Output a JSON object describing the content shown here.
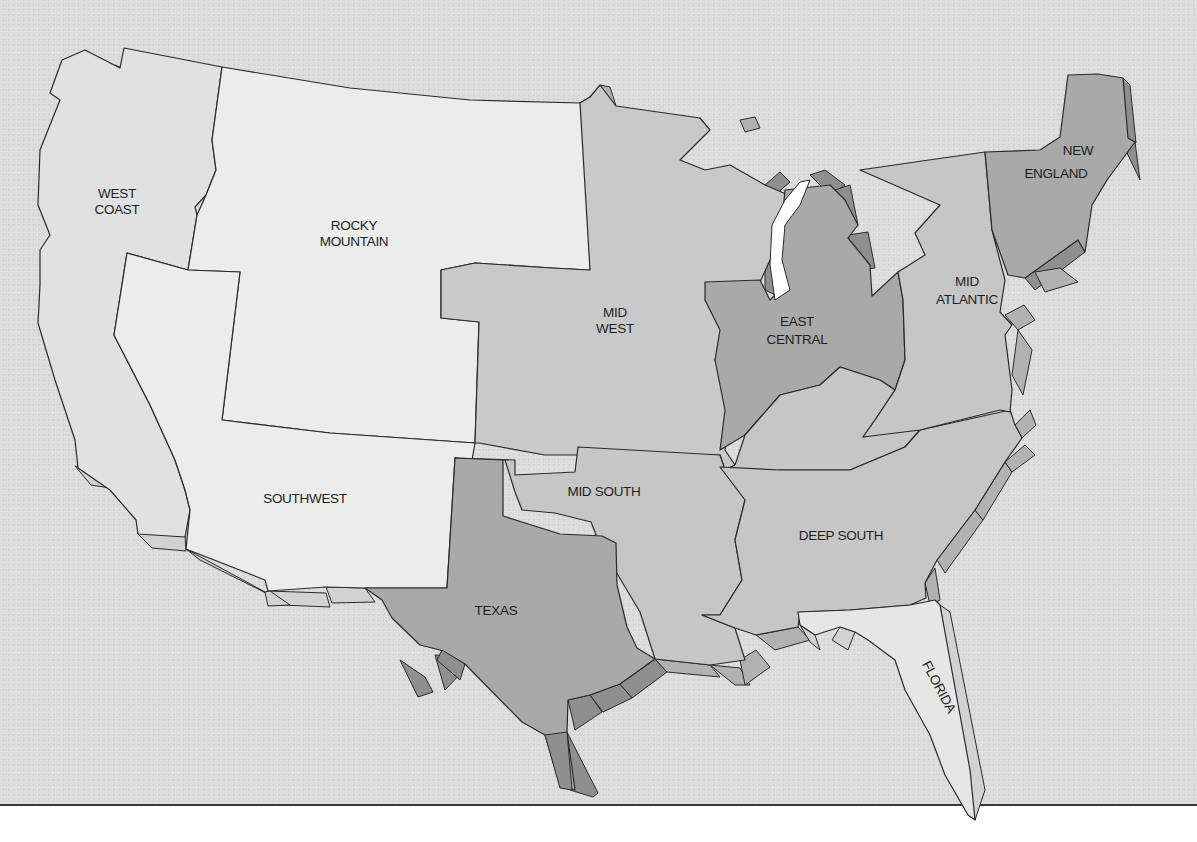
{
  "map": {
    "type": "region-map",
    "subject": "United States sales regions",
    "colors": {
      "background": "#dcdcdc",
      "light_tier": "#ececec",
      "mid_tier": "#c6c6c6",
      "dark_tier": "#a9a9a9",
      "edge_light": "#d2d2d2",
      "edge_mid": "#b2b2b2",
      "edge_dark": "#8f8f8f",
      "lake": "#ffffff",
      "outline": "#2a2a2a"
    },
    "regions": [
      {
        "id": "west-coast",
        "label_lines": [
          "WEST",
          "COAST"
        ],
        "shade": "mid_tier"
      },
      {
        "id": "rocky-mountain",
        "label_lines": [
          "ROCKY",
          "MOUNTAIN"
        ],
        "shade": "light_tier"
      },
      {
        "id": "southwest",
        "label_lines": [
          "SOUTHWEST"
        ],
        "shade": "light_tier"
      },
      {
        "id": "mid-west",
        "label_lines": [
          "MID",
          "WEST"
        ],
        "shade": "mid_tier"
      },
      {
        "id": "texas",
        "label_lines": [
          "TEXAS"
        ],
        "shade": "dark_tier"
      },
      {
        "id": "mid-south",
        "label_lines": [
          "MID SOUTH"
        ],
        "shade": "mid_tier"
      },
      {
        "id": "east-central",
        "label_lines": [
          "EAST",
          "CENTRAL"
        ],
        "shade": "dark_tier"
      },
      {
        "id": "deep-south",
        "label_lines": [
          "DEEP SOUTH"
        ],
        "shade": "mid_tier"
      },
      {
        "id": "mid-atlantic",
        "label_lines": [
          "MID",
          "ATLANTIC"
        ],
        "shade": "mid_tier"
      },
      {
        "id": "new-england",
        "label_lines": [
          "NEW",
          "ENGLAND"
        ],
        "shade": "dark_tier"
      },
      {
        "id": "florida",
        "label_lines": [
          "FLORIDA"
        ],
        "shade": "light_tier"
      }
    ]
  }
}
